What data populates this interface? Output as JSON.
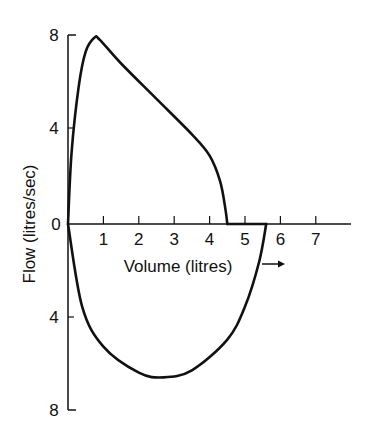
{
  "chart_data": {
    "type": "line",
    "title": "",
    "xlabel": "Volume (litres)",
    "ylabel": "Flow (litres/sec)",
    "xlim": [
      0,
      8
    ],
    "ylim": [
      -8,
      8
    ],
    "x_ticks": [
      "1",
      "2",
      "3",
      "4",
      "5",
      "6",
      "7"
    ],
    "y_ticks_upper": [
      "8",
      "4",
      "0"
    ],
    "y_ticks_lower": [
      "4",
      "8"
    ],
    "grid": false,
    "legend": null,
    "annotations": [
      "arrow pointing right indicating volume direction"
    ],
    "series": [
      {
        "name": "Expiratory flow",
        "x": [
          0.0,
          0.1,
          0.3,
          0.5,
          0.75,
          0.9,
          1.5,
          2.5,
          3.5,
          4.0,
          4.3,
          4.45,
          4.5
        ],
        "y": [
          0.0,
          3.0,
          5.8,
          7.3,
          7.9,
          7.8,
          6.8,
          5.3,
          3.8,
          2.9,
          1.8,
          0.6,
          0.0
        ]
      },
      {
        "name": "Residual (zero flow)",
        "x": [
          4.5,
          5.6
        ],
        "y": [
          0.0,
          0.0
        ]
      },
      {
        "name": "Inspiratory flow",
        "x": [
          5.6,
          5.4,
          5.0,
          4.5,
          3.5,
          2.7,
          2.0,
          1.0,
          0.4,
          0.0
        ],
        "y": [
          0.0,
          -1.6,
          -3.5,
          -4.9,
          -6.2,
          -6.5,
          -6.3,
          -5.2,
          -3.5,
          0.0
        ]
      }
    ]
  }
}
